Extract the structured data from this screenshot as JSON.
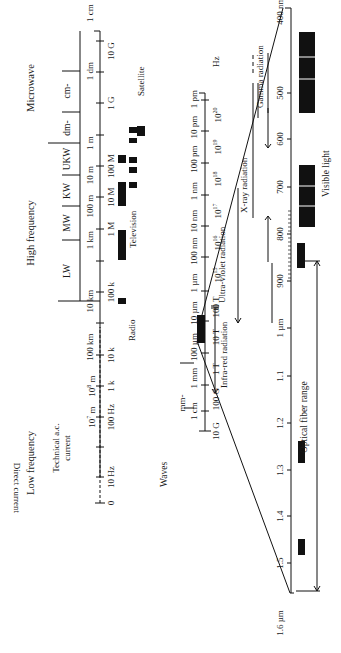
{
  "upper_scale": {
    "headings": {
      "low_frequency": "Low frequency",
      "high_frequency": "High frequency",
      "microwave": "Microwave",
      "technical_ac_line1": "Technical a.c.",
      "technical_ac_line2": "current",
      "direct_current": "Direct current"
    },
    "bands": [
      "LW",
      "MW",
      "KW",
      "UKW",
      "dm-",
      "cm-"
    ],
    "wavelength_ticks": [
      "10^7 m",
      "10^8 m",
      "100 km",
      "10 km",
      "1 km",
      "100 m",
      "10 m",
      "1 m",
      "1 dm",
      "1 cm"
    ],
    "wavelength_ticks_display": [
      "107 m",
      "108 m",
      "100 km",
      "10 km",
      "1 km",
      "100 m",
      "10 m",
      "1 m",
      "1 dm",
      "1 cm"
    ],
    "frequency_ticks": [
      "0",
      "10 Hz",
      "100 Hz",
      "1 k",
      "10 k",
      "100 k",
      "1 M",
      "10 M",
      "100 M",
      "1 G",
      "10 G"
    ],
    "applications": [
      "Radio",
      "Television",
      "Satellite"
    ]
  },
  "lower_scale": {
    "title": "Waves",
    "band_label": "mm-",
    "wavelength_ticks": [
      "1 cm",
      "1 mm",
      "100 µm",
      "10 µm",
      "1 µm",
      "100 nm",
      "10 nm",
      "1 nm",
      "100 pm",
      "10 pm",
      "1 pm"
    ],
    "frequency_ticks": [
      "10 G",
      "100 G",
      "1 T",
      "10 T",
      "100 T",
      "10^15",
      "10^16",
      "10^17",
      "10^18",
      "10^19",
      "10^20"
    ],
    "frequency_unit": "Hz",
    "radiation_labels": [
      "Infra-red radiation",
      "Ultra-violet radiation",
      "X-ray radiation",
      "Gamma radiation"
    ]
  },
  "optical_scale": {
    "wavelength_ticks": [
      "400 nm",
      "500",
      "600",
      "700",
      "800",
      "900",
      "1 µm",
      "1.1",
      "1.2",
      "1.3",
      "1.4",
      "1.5",
      "1.6 µm"
    ],
    "visible_label": "Visible light",
    "fiber_label": "Optical fiber range"
  }
}
